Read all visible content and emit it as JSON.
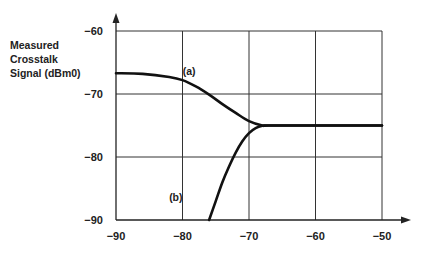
{
  "chart_data": {
    "type": "line",
    "title": "",
    "xlabel": "",
    "ylabel": "Measured Crosstalk Signal (dBm0)",
    "ylabel_lines": [
      "Measured",
      "Crosstalk",
      "Signal (dBm0)"
    ],
    "xlim": [
      -90,
      -50
    ],
    "ylim": [
      -90,
      -60
    ],
    "x_ticks": [
      -90,
      -80,
      -70,
      -60,
      -50
    ],
    "y_ticks": [
      -60,
      -70,
      -80,
      -90
    ],
    "x_tick_labels": [
      "−90",
      "−80",
      "−70",
      "−60",
      "−50"
    ],
    "y_tick_labels": [
      "−60",
      "−70",
      "−80",
      "−90"
    ],
    "grid": true,
    "legend": null,
    "series": [
      {
        "name": "(a)",
        "label": "(a)",
        "x": [
          -90,
          -86,
          -82,
          -80,
          -78,
          -76,
          -74,
          -72,
          -70,
          -68,
          -67,
          -60,
          -50
        ],
        "y": [
          -66.7,
          -66.8,
          -67.3,
          -67.8,
          -68.8,
          -70.1,
          -71.6,
          -73.0,
          -74.3,
          -75.0,
          -75.0,
          -75.0,
          -75.0
        ]
      },
      {
        "name": "(b)",
        "label": "(b)",
        "x": [
          -76,
          -75,
          -74,
          -73,
          -72,
          -71,
          -70,
          -69,
          -68,
          -67,
          -60,
          -50
        ],
        "y": [
          -90,
          -87.0,
          -84.0,
          -81.5,
          -79.3,
          -77.5,
          -76.2,
          -75.4,
          -75.05,
          -75.0,
          -75.0,
          -75.0
        ]
      }
    ],
    "annotations": [
      {
        "text": "(a)",
        "x": -79,
        "y": -67
      },
      {
        "text": "(b)",
        "x": -81,
        "y": -87
      }
    ]
  }
}
